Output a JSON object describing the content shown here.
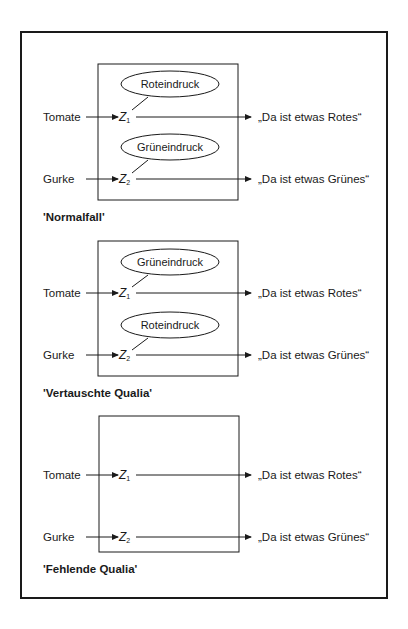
{
  "panels": [
    {
      "title": "'Normalfall'",
      "rows": [
        {
          "input": "Tomate",
          "state": "Z",
          "sub": "1",
          "quale": "Roteindruck",
          "output": "„Da ist etwas Rotes“"
        },
        {
          "input": "Gurke",
          "state": "Z",
          "sub": "2",
          "quale": "Grüneindruck",
          "output": "„Da ist etwas Grünes“"
        }
      ]
    },
    {
      "title": "'Vertauschte Qualia'",
      "rows": [
        {
          "input": "Tomate",
          "state": "Z",
          "sub": "1",
          "quale": "Grüneindruck",
          "output": "„Da ist etwas Rotes“"
        },
        {
          "input": "Gurke",
          "state": "Z",
          "sub": "2",
          "quale": "Roteindruck",
          "output": "„Da ist etwas Grünes“"
        }
      ]
    },
    {
      "title": "'Fehlende Qualia'",
      "rows": [
        {
          "input": "Tomate",
          "state": "Z",
          "sub": "1",
          "quale": null,
          "output": "„Da ist etwas Rotes“"
        },
        {
          "input": "Gurke",
          "state": "Z",
          "sub": "2",
          "quale": null,
          "output": "„Da ist etwas Grünes“"
        }
      ]
    }
  ]
}
